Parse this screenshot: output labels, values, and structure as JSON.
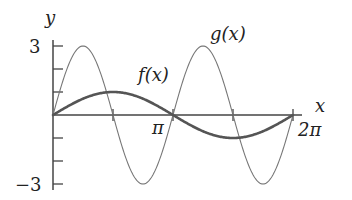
{
  "chart_data": {
    "type": "line",
    "title": "",
    "xlabel": "x",
    "ylabel": "y",
    "xlim": [
      0,
      6.2832
    ],
    "ylim": [
      -3,
      3
    ],
    "grid": false,
    "x_ticks": [
      {
        "value": 1.5708,
        "label": ""
      },
      {
        "value": 3.14159,
        "label": "π"
      },
      {
        "value": 4.7124,
        "label": ""
      },
      {
        "value": 6.28319,
        "label": "2π"
      }
    ],
    "y_ticks": [
      {
        "value": 3,
        "label": "3"
      },
      {
        "value": 2,
        "label": ""
      },
      {
        "value": 1,
        "label": ""
      },
      {
        "value": -1,
        "label": ""
      },
      {
        "value": -2,
        "label": ""
      },
      {
        "value": -3,
        "label": "−3"
      }
    ],
    "series": [
      {
        "name": "f(x)",
        "expression": "sin(x)",
        "style": "thick",
        "color": "#555555",
        "x": [
          0,
          0.7854,
          1.5708,
          2.3562,
          3.1416,
          3.927,
          4.7124,
          5.4978,
          6.2832
        ],
        "values": [
          0,
          0.71,
          1,
          0.71,
          0,
          -0.71,
          -1,
          -0.71,
          0
        ]
      },
      {
        "name": "g(x)",
        "expression": "3 sin(2x)",
        "style": "thin",
        "color": "#777777",
        "x": [
          0,
          0.7854,
          1.5708,
          2.3562,
          3.1416,
          3.927,
          4.7124,
          5.4978,
          6.2832
        ],
        "values": [
          0,
          3,
          0,
          -3,
          0,
          3,
          0,
          -3,
          0
        ]
      }
    ],
    "annotations": [
      {
        "text": "f(x)",
        "near_series": "f(x)"
      },
      {
        "text": "g(x)",
        "near_series": "g(x)"
      }
    ]
  },
  "labels": {
    "y_axis": "y",
    "x_axis": "x",
    "y_max": "3",
    "y_min": "−3",
    "x_pi": "π",
    "x_two_pi": "2π",
    "f_label": "f(x)",
    "g_label": "g(x)"
  },
  "colors": {
    "axis": "#444444",
    "f_curve": "#555555",
    "g_curve": "#777777"
  }
}
